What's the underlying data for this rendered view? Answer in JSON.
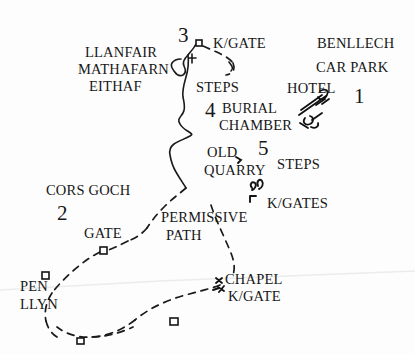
{
  "map": {
    "title": "Benllech circular walk sketch map",
    "background_color": "#fdfdfd",
    "ink_color": "#171717",
    "numbered_stops": [
      {
        "id": "stop-1",
        "number": "1",
        "x": 357,
        "y": 97
      },
      {
        "id": "stop-2",
        "number": "2",
        "x": 62,
        "y": 212
      },
      {
        "id": "stop-3",
        "number": "3",
        "x": 182,
        "y": 36
      },
      {
        "id": "stop-4",
        "number": "4",
        "x": 211,
        "y": 110
      },
      {
        "id": "stop-5",
        "number": "5",
        "x": 263,
        "y": 149
      }
    ],
    "labels": [
      {
        "id": "label-llanfair",
        "text": "LLANFAIR",
        "x": 85,
        "y": 55
      },
      {
        "id": "label-mathafarn",
        "text": "MATHAFARN",
        "x": 78,
        "y": 71
      },
      {
        "id": "label-eithaf",
        "text": "EITHAF",
        "x": 89,
        "y": 87
      },
      {
        "id": "label-kgate-top",
        "text": "K/GATE",
        "x": 215,
        "y": 45
      },
      {
        "id": "label-benllech",
        "text": "BENLLECH",
        "x": 318,
        "y": 45
      },
      {
        "id": "label-car-park",
        "text": "CAR PARK",
        "x": 317,
        "y": 69
      },
      {
        "id": "label-hotel",
        "text": "HOTEL",
        "x": 288,
        "y": 90
      },
      {
        "id": "label-steps-upper",
        "text": "STEPS",
        "x": 197,
        "y": 89
      },
      {
        "id": "label-burial",
        "text": "BURIAL",
        "x": 227,
        "y": 110
      },
      {
        "id": "label-chamber",
        "text": "CHAMBER",
        "x": 224,
        "y": 127
      },
      {
        "id": "label-old",
        "text": "OLD",
        "x": 211,
        "y": 154
      },
      {
        "id": "label-quarry",
        "text": "QUARRY",
        "x": 207,
        "y": 172
      },
      {
        "id": "label-steps-lower",
        "text": "STEPS",
        "x": 280,
        "y": 165
      },
      {
        "id": "label-kgates",
        "text": "K/GATES",
        "x": 270,
        "y": 205
      },
      {
        "id": "label-cors-goch",
        "text": "CORS GOCH",
        "x": 48,
        "y": 192
      },
      {
        "id": "label-permissive",
        "text": "PERMISSIVE",
        "x": 164,
        "y": 219
      },
      {
        "id": "label-path",
        "text": "PATH",
        "x": 168,
        "y": 237
      },
      {
        "id": "label-gate",
        "text": "GATE",
        "x": 86,
        "y": 235
      },
      {
        "id": "label-pen",
        "text": "PEN",
        "x": 22,
        "y": 288
      },
      {
        "id": "label-llyn",
        "text": "LLYN",
        "x": 22,
        "y": 306
      },
      {
        "id": "label-chapel",
        "text": "CHAPEL",
        "x": 228,
        "y": 281
      },
      {
        "id": "label-chapel-kgate",
        "text": "K/GATE",
        "x": 231,
        "y": 298
      }
    ],
    "features": {
      "solid_path_name": "footpath-solid",
      "dashed_path_name": "footpath-dashed",
      "gate_marker_name": "gate-marker",
      "kissing_gate_name": "kissing-gate-marker",
      "building_sketch_name": "hotel-building-sketch",
      "scan_line_name": "scan-artifact-line"
    }
  }
}
